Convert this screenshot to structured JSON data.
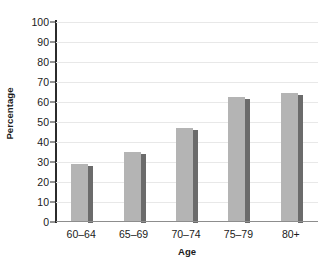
{
  "chart_data": {
    "type": "bar",
    "title": "",
    "xlabel": "Age",
    "ylabel": "Percentage",
    "categories": [
      "60–64",
      "65–69",
      "70–74",
      "75–79",
      "80+"
    ],
    "values": [
      28.5,
      34.5,
      46.5,
      62,
      64
    ],
    "ylim": [
      0,
      100
    ],
    "yticks": [
      0,
      10,
      20,
      30,
      40,
      50,
      60,
      70,
      80,
      90,
      100
    ],
    "ytick_labels": [
      "0",
      "10",
      "20",
      "30",
      "40",
      "50",
      "60",
      "70",
      "80",
      "90",
      "100"
    ],
    "grid": true,
    "legend": false,
    "series": [
      {
        "name": "Percentage",
        "values": [
          28.5,
          34.5,
          46.5,
          62,
          64
        ]
      }
    ],
    "colors": {
      "bar_face": "#b4b4b4",
      "bar_side": "#6b6b6b",
      "gridline": "#e8e8e8",
      "axis": "#2b2b2b",
      "baseline": "#8d8d8d",
      "text": "#1a1a1a",
      "background": "#ffffff"
    }
  }
}
